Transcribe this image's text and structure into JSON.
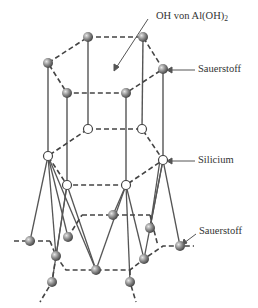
{
  "diagram": {
    "labels": {
      "oh": "OH von Al(OH)",
      "oh_sub": "2",
      "oxygen_top": "Sauerstoff",
      "silicon": "Silicium",
      "oxygen_bottom": "Sauerstoff"
    },
    "colors": {
      "line": "#4a4a4a",
      "oxygen_fill": "#8a8a8a",
      "silicon_fill": "#ffffff",
      "text": "#333333"
    },
    "atoms": {
      "top_oh_layer": [
        [
          88,
          37
        ],
        [
          143,
          37
        ],
        [
          48,
          63
        ],
        [
          163,
          69
        ],
        [
          67,
          93
        ],
        [
          126,
          93
        ]
      ],
      "silicon_layer": [
        [
          88,
          129
        ],
        [
          142,
          129
        ],
        [
          48,
          156
        ],
        [
          163,
          160
        ],
        [
          67,
          185
        ],
        [
          126,
          185
        ]
      ],
      "bottom_oxygen_layer": [
        [
          30,
          241
        ],
        [
          68,
          237
        ],
        [
          56,
          256
        ],
        [
          52,
          282
        ],
        [
          113,
          215
        ],
        [
          96,
          270
        ],
        [
          150,
          228
        ],
        [
          144,
          259
        ],
        [
          130,
          282
        ],
        [
          180,
          246
        ]
      ]
    }
  }
}
